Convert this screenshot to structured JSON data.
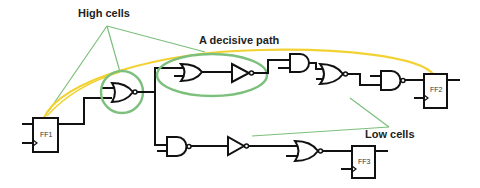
{
  "labels": {
    "high_cells": "High cells",
    "decisive_path": "A decisive path",
    "low_cells": "Low cells"
  },
  "flip_flops": {
    "ff1": "FF1",
    "ff2": "FF2",
    "ff3": "FF3"
  },
  "colors": {
    "highlight": "#7dc07d",
    "annotation_line": "#7bbf7b",
    "decisive_path": "#f2d233",
    "wire": "#111111"
  },
  "gates": {
    "high_path": [
      "NOR",
      "OR",
      "NOT",
      "AND",
      "NOR",
      "NAND"
    ],
    "low_path": [
      "NAND",
      "NOT",
      "NOR"
    ]
  }
}
